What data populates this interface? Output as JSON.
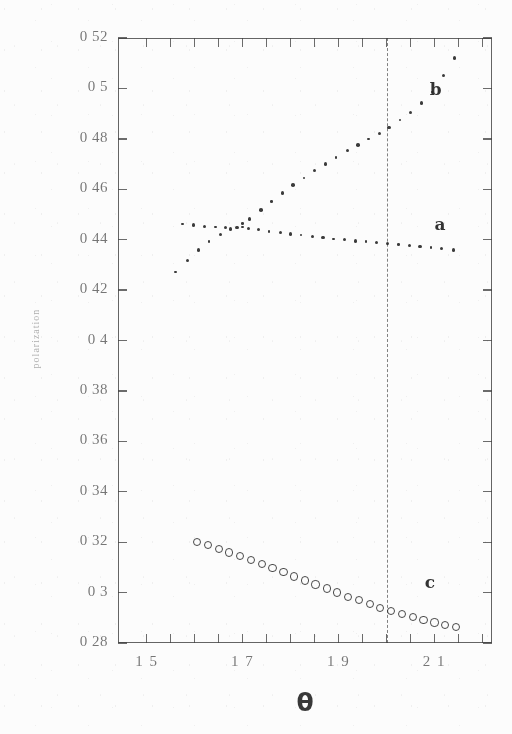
{
  "chart_data": {
    "type": "scatter",
    "title": "",
    "subtitle": "",
    "xlabel": "θ",
    "ylabel": "polarization",
    "xlim": [
      1.44,
      2.22
    ],
    "ylim": [
      0.28,
      0.52
    ],
    "grid": false,
    "legend_position": "inline-annotations",
    "x_ticks_labeled": [
      "1.5",
      "1.7",
      "1.9",
      "2.1"
    ],
    "x_ticks_labeled_values": [
      1.5,
      1.7,
      1.9,
      2.1
    ],
    "x_ticks_minor_values": [
      1.5,
      1.55,
      1.6,
      1.65,
      1.7,
      1.75,
      1.8,
      1.85,
      1.9,
      1.95,
      2.0,
      2.05,
      2.1,
      2.15,
      2.2
    ],
    "y_ticks": [
      "0.28",
      "0.3",
      "0.32",
      "0.34",
      "0.36",
      "0.38",
      "0.4",
      "0.42",
      "0.44",
      "0.46",
      "0.48",
      "0.5",
      "0.52"
    ],
    "y_tick_values": [
      0.28,
      0.3,
      0.32,
      0.34,
      0.36,
      0.38,
      0.4,
      0.42,
      0.44,
      0.46,
      0.48,
      0.5,
      0.52
    ],
    "annotations": [
      {
        "text": "b",
        "x": 2.09,
        "y": 0.499,
        "style": "bold"
      },
      {
        "text": "a",
        "x": 2.1,
        "y": 0.4455,
        "style": "bold"
      },
      {
        "text": "c",
        "x": 2.08,
        "y": 0.3035,
        "style": "bold"
      }
    ],
    "reference_lines": [
      {
        "orientation": "vertical",
        "value": 2.0,
        "style": "dashed"
      }
    ],
    "series": [
      {
        "name": "a",
        "marker": "filled-dot",
        "x": [
          1.575,
          1.598,
          1.62,
          1.643,
          1.665,
          1.688,
          1.7,
          1.712,
          1.733,
          1.755,
          1.778,
          1.8,
          1.822,
          1.845,
          1.868,
          1.89,
          1.912,
          1.935,
          1.957,
          1.98,
          2.002,
          2.025,
          2.048,
          2.07,
          2.093,
          2.115,
          2.14
        ],
        "y": [
          0.4462,
          0.4458,
          0.4452,
          0.445,
          0.4447,
          0.4448,
          0.445,
          0.4446,
          0.444,
          0.4433,
          0.4428,
          0.4423,
          0.4419,
          0.4413,
          0.4408,
          0.4403,
          0.4399,
          0.4395,
          0.4392,
          0.4389,
          0.4385,
          0.4381,
          0.4377,
          0.4373,
          0.4369,
          0.4364,
          0.4358
        ]
      },
      {
        "name": "b",
        "marker": "filled-dot",
        "x": [
          1.56,
          1.585,
          1.608,
          1.63,
          1.653,
          1.675,
          1.7,
          1.715,
          1.738,
          1.76,
          1.783,
          1.805,
          1.828,
          1.85,
          1.873,
          1.895,
          1.918,
          1.94,
          1.963,
          1.985,
          2.005,
          2.028,
          2.05,
          2.073,
          2.095,
          2.118,
          2.142
        ],
        "y": [
          0.4272,
          0.4318,
          0.4358,
          0.4392,
          0.442,
          0.4442,
          0.4465,
          0.4482,
          0.4518,
          0.4552,
          0.4585,
          0.4616,
          0.4645,
          0.4673,
          0.47,
          0.4726,
          0.4752,
          0.4776,
          0.48,
          0.4822,
          0.4845,
          0.4875,
          0.4905,
          0.4942,
          0.4985,
          0.505,
          0.512
        ]
      },
      {
        "name": "c",
        "marker": "open-circle",
        "x": [
          1.603,
          1.625,
          1.648,
          1.67,
          1.693,
          1.715,
          1.738,
          1.76,
          1.783,
          1.805,
          1.828,
          1.85,
          1.873,
          1.895,
          1.918,
          1.94,
          1.963,
          1.985,
          2.008,
          2.03,
          2.053,
          2.075,
          2.098,
          2.12,
          2.143
        ],
        "y": [
          0.3205,
          0.3192,
          0.3178,
          0.3163,
          0.3148,
          0.3132,
          0.3116,
          0.31,
          0.3084,
          0.3068,
          0.3052,
          0.3036,
          0.302,
          0.3004,
          0.2988,
          0.2973,
          0.2958,
          0.2944,
          0.293,
          0.2918,
          0.2906,
          0.2895,
          0.2885,
          0.2876,
          0.2868
        ]
      }
    ]
  },
  "axes": {
    "x_title": "θ",
    "y_title": "polarization"
  }
}
